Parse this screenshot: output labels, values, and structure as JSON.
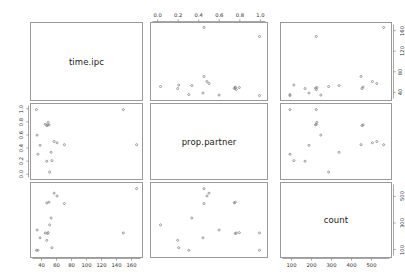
{
  "plot": {
    "type": "scatterplot-matrix",
    "variables": [
      "time.ipc",
      "prop.partner",
      "count"
    ],
    "diagonal_labels": {
      "d0": "time.ipc",
      "d1": "prop.partner",
      "d2": "count"
    }
  },
  "axes": {
    "time_ipc": {
      "label": "time.ipc",
      "ticks": [
        40,
        60,
        80,
        100,
        120,
        140,
        160
      ],
      "range": [
        28,
        172
      ],
      "bottom_tick_labels": [
        "40",
        "60",
        "80",
        "100",
        "120",
        "140",
        "160"
      ],
      "right_tick_labels": [
        "40",
        "80",
        "120",
        "160"
      ],
      "right_ticks": [
        40,
        80,
        120,
        160
      ]
    },
    "prop_partner": {
      "label": "prop.partner",
      "ticks": [
        0.0,
        0.2,
        0.4,
        0.6,
        0.8,
        1.0
      ],
      "range": [
        -0.05,
        1.05
      ],
      "top_tick_labels": [
        "0.0",
        "0.2",
        "0.4",
        "0.6",
        "0.8",
        "1.0"
      ],
      "left_tick_labels": [
        "1.0",
        "0.8",
        "0.6",
        "0.4",
        "0.2",
        "0.0"
      ]
    },
    "count": {
      "label": "count",
      "ticks": [
        100,
        200,
        300,
        400,
        500
      ],
      "range": [
        55,
        590
      ],
      "bottom_tick_labels": [
        "100",
        "200",
        "300",
        "400",
        "500"
      ],
      "right_tick_labels": [
        "100",
        "300",
        "500"
      ],
      "right_ticks": [
        100,
        300,
        500
      ]
    }
  },
  "chart_data": {
    "type": "scatter",
    "title": "",
    "xlabel": "",
    "ylabel": "",
    "variables": [
      "time.ipc",
      "prop.partner",
      "count"
    ],
    "axis_ranges": {
      "time.ipc": [
        28,
        172
      ],
      "prop.partner": [
        -0.05,
        1.05
      ],
      "count": [
        55,
        590
      ]
    },
    "grid": false,
    "legend": "none",
    "point_color": "#808080",
    "n": 18,
    "columns": [
      "time.ipc",
      "prop.partner",
      "count"
    ],
    "rows": [
      {
        "time.ipc": 32,
        "prop.partner": 1.0,
        "count": 88
      },
      {
        "time.ipc": 33,
        "prop.partner": 0.6,
        "count": 245
      },
      {
        "time.ipc": 34,
        "prop.partner": 0.3,
        "count": 88
      },
      {
        "time.ipc": 37,
        "prop.partner": 0.44,
        "count": 185
      },
      {
        "time.ipc": 44,
        "prop.partner": 0.77,
        "count": 222
      },
      {
        "time.ipc": 46,
        "prop.partner": 0.75,
        "count": 455
      },
      {
        "time.ipc": 46,
        "prop.partner": 0.19,
        "count": 165
      },
      {
        "time.ipc": 47,
        "prop.partner": 0.76,
        "count": 218
      },
      {
        "time.ipc": 48,
        "prop.partner": 0.8,
        "count": 225
      },
      {
        "time.ipc": 49,
        "prop.partner": 0.76,
        "count": 460
      },
      {
        "time.ipc": 50,
        "prop.partner": 0.02,
        "count": 285
      },
      {
        "time.ipc": 52,
        "prop.partner": 0.33,
        "count": 338
      },
      {
        "time.ipc": 53,
        "prop.partner": 0.2,
        "count": 108
      },
      {
        "time.ipc": 56,
        "prop.partner": 0.5,
        "count": 530
      },
      {
        "time.ipc": 60,
        "prop.partner": 0.48,
        "count": 508
      },
      {
        "time.ipc": 70,
        "prop.partner": 0.45,
        "count": 450
      },
      {
        "time.ipc": 150,
        "prop.partner": 1.0,
        "count": 222
      },
      {
        "time.ipc": 168,
        "prop.partner": 0.45,
        "count": 565
      }
    ],
    "panels": [
      {
        "row": 0,
        "col": 0,
        "kind": "diagonal",
        "label": "time.ipc"
      },
      {
        "row": 0,
        "col": 1,
        "kind": "scatter",
        "x": "prop.partner",
        "y": "time.ipc"
      },
      {
        "row": 0,
        "col": 2,
        "kind": "scatter",
        "x": "count",
        "y": "time.ipc"
      },
      {
        "row": 1,
        "col": 0,
        "kind": "scatter",
        "x": "time.ipc",
        "y": "prop.partner"
      },
      {
        "row": 1,
        "col": 1,
        "kind": "diagonal",
        "label": "prop.partner"
      },
      {
        "row": 1,
        "col": 2,
        "kind": "scatter",
        "x": "count",
        "y": "prop.partner"
      },
      {
        "row": 2,
        "col": 0,
        "kind": "scatter",
        "x": "time.ipc",
        "y": "count"
      },
      {
        "row": 2,
        "col": 1,
        "kind": "scatter",
        "x": "prop.partner",
        "y": "count"
      },
      {
        "row": 2,
        "col": 2,
        "kind": "diagonal",
        "label": "count"
      }
    ]
  }
}
